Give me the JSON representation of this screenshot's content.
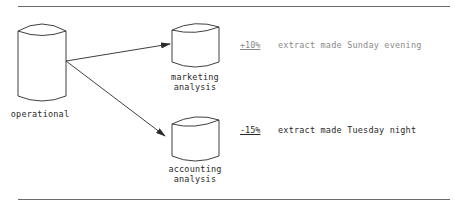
{
  "diagram": {
    "source": {
      "label": "operational"
    },
    "targets": [
      {
        "label_line1": "marketing",
        "label_line2": "analysis",
        "change": "+10%",
        "note": "extract made Sunday evening"
      },
      {
        "label_line1": "accounting",
        "label_line2": "analysis",
        "change": "-15%",
        "note": "extract made Tuesday night"
      }
    ],
    "colors": {
      "stroke": "#2a2a2a",
      "rule": "#6a6a6a",
      "background": "#ffffff"
    }
  }
}
